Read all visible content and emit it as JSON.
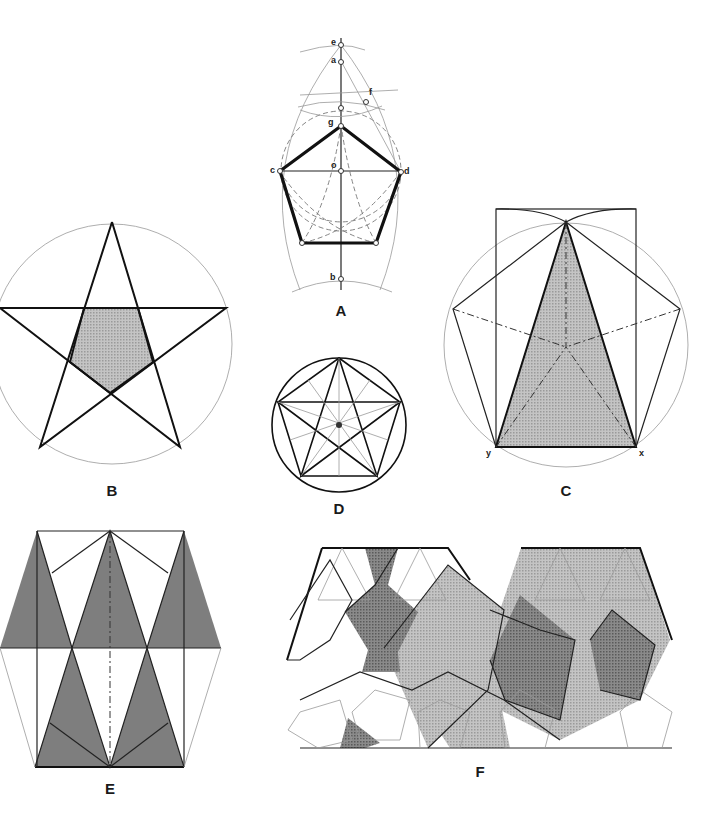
{
  "figures": [
    {
      "id": "A",
      "label": "A",
      "description": "Construction of a regular pentagon inscribed in a circle using compass arcs",
      "points": [
        {
          "name": "e",
          "label": "e"
        },
        {
          "name": "a",
          "label": "a"
        },
        {
          "name": "f",
          "label": "f"
        },
        {
          "name": "g",
          "label": "g"
        },
        {
          "name": "c",
          "label": "c"
        },
        {
          "name": "o",
          "label": "o"
        },
        {
          "name": "d",
          "label": "d"
        },
        {
          "name": "b",
          "label": "b"
        }
      ]
    },
    {
      "id": "B",
      "label": "B",
      "description": "Pentagram inscribed in a circle with shaded inner pentagon"
    },
    {
      "id": "C",
      "label": "C",
      "description": "Pentagon in circle with shaded golden triangle inside a rectangle",
      "points": [
        {
          "name": "y",
          "label": "y"
        },
        {
          "name": "x",
          "label": "x"
        }
      ]
    },
    {
      "id": "D",
      "label": "D",
      "description": "Pentagram inside pentagon inside circle with radial lines"
    },
    {
      "id": "E",
      "label": "E",
      "description": "Tiling of shaded golden triangles forming hexagonal band"
    },
    {
      "id": "F",
      "label": "F",
      "description": "Penrose-like tiling of pentagons and shaded regions"
    }
  ],
  "colors": {
    "background": "#ffffff",
    "line": "#111111",
    "guide": "#999999",
    "shade_light": "#b8b8b8",
    "shade_medium": "#9a9a9a",
    "shade_dark": "#6e6e6e"
  }
}
